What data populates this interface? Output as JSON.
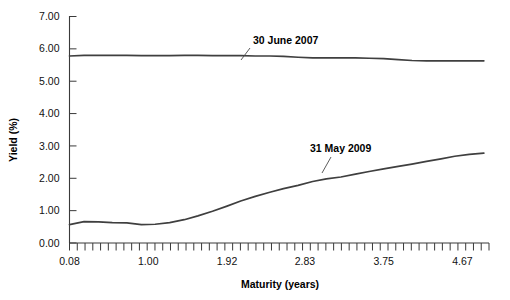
{
  "chart_data": {
    "type": "line",
    "title": "",
    "xlabel": "Maturity (years)",
    "ylabel": "Yield (%)",
    "xlim": [
      0.08,
      5.0
    ],
    "ylim": [
      0.0,
      7.0
    ],
    "grid": false,
    "legend_position": "inline-annotations",
    "ytick_labels": [
      "7.00",
      "6.00",
      "5.00",
      "4.00",
      "3.00",
      "2.00",
      "1.00",
      "0.00"
    ],
    "ytick_values": [
      7.0,
      6.0,
      5.0,
      4.0,
      3.0,
      2.0,
      1.0,
      0.0
    ],
    "xtick_labels": [
      "0.08",
      "1.00",
      "1.92",
      "2.83",
      "3.75",
      "4.67"
    ],
    "xtick_values": [
      0.08,
      1.0,
      1.92,
      2.83,
      3.75,
      4.67
    ],
    "minor_tick_count": 54,
    "line_color": "#3f3f3f",
    "series": [
      {
        "name": "30 June 2007",
        "annotation": "30 June 2007",
        "x": [
          0.08,
          0.25,
          0.42,
          0.58,
          0.75,
          0.92,
          1.08,
          1.25,
          1.42,
          1.58,
          1.75,
          1.92,
          2.08,
          2.25,
          2.42,
          2.58,
          2.75,
          2.92,
          3.08,
          3.25,
          3.42,
          3.58,
          3.75,
          3.92,
          4.08,
          4.25,
          4.42,
          4.58,
          4.75,
          4.92
        ],
        "y": [
          5.78,
          5.8,
          5.8,
          5.8,
          5.8,
          5.79,
          5.79,
          5.79,
          5.8,
          5.8,
          5.79,
          5.79,
          5.79,
          5.78,
          5.78,
          5.77,
          5.74,
          5.72,
          5.72,
          5.72,
          5.72,
          5.71,
          5.7,
          5.67,
          5.64,
          5.63,
          5.63,
          5.63,
          5.63,
          5.63
        ]
      },
      {
        "name": "31 May 2009",
        "annotation": "31 May 2009",
        "x": [
          0.08,
          0.25,
          0.42,
          0.58,
          0.75,
          0.92,
          1.08,
          1.25,
          1.42,
          1.58,
          1.75,
          1.92,
          2.08,
          2.25,
          2.42,
          2.58,
          2.75,
          2.92,
          3.08,
          3.25,
          3.42,
          3.58,
          3.75,
          3.92,
          4.08,
          4.25,
          4.42,
          4.58,
          4.75,
          4.92
        ],
        "y": [
          0.57,
          0.66,
          0.65,
          0.63,
          0.62,
          0.57,
          0.58,
          0.63,
          0.72,
          0.84,
          0.98,
          1.14,
          1.3,
          1.44,
          1.57,
          1.68,
          1.78,
          1.9,
          1.98,
          2.04,
          2.13,
          2.21,
          2.29,
          2.37,
          2.44,
          2.52,
          2.6,
          2.68,
          2.74,
          2.78
        ]
      }
    ],
    "annotations": [
      {
        "label": "30 June 2007",
        "text_x": 253,
        "text_y": 44,
        "leader": [
          250,
          48,
          241,
          60
        ]
      },
      {
        "label": "31 May 2009",
        "text_x": 310,
        "text_y": 152,
        "leader": [
          331,
          157,
          322,
          173
        ]
      }
    ]
  }
}
